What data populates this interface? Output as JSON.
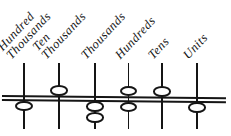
{
  "diagram": {
    "kind": "abacus-place-value",
    "ink_color": "#151515",
    "background_color": "#ffffff",
    "bar_lines": 2,
    "rods": [
      {
        "label": "Hundred Thousands",
        "label_lines": [
          "Hundred",
          "Thousands"
        ],
        "beads_above_bar": 0,
        "beads_below_bar": 1
      },
      {
        "label": "Ten Thousands",
        "label_lines": [
          "Ten",
          "Thousands"
        ],
        "beads_above_bar": 1,
        "beads_below_bar": 0
      },
      {
        "label": "Thousands",
        "label_lines": [
          "Thousands"
        ],
        "beads_above_bar": 0,
        "beads_below_bar": 2
      },
      {
        "label": "Hundreds",
        "label_lines": [
          "Hundreds"
        ],
        "beads_above_bar": 1,
        "beads_below_bar": 1
      },
      {
        "label": "Tens",
        "label_lines": [
          "Tens"
        ],
        "beads_above_bar": 1,
        "beads_below_bar": 0
      },
      {
        "label": "Units",
        "label_lines": [
          "Units"
        ],
        "beads_above_bar": 0,
        "beads_below_bar": 1
      }
    ]
  }
}
